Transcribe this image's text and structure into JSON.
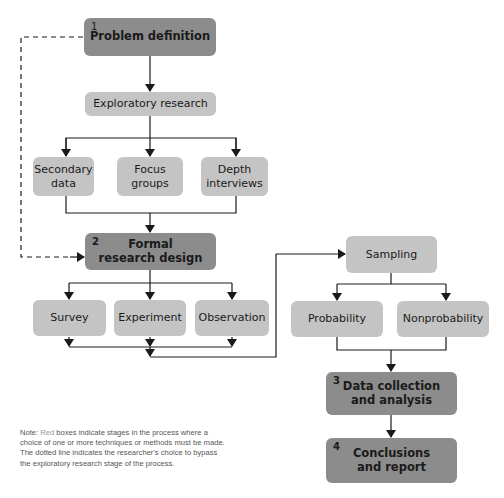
{
  "diagram": {
    "type": "flowchart",
    "colors": {
      "stage_box": "#8c8c8c",
      "option_box": "#c4c4c4",
      "line": "#1a1a1a"
    },
    "stages": [
      {
        "number": "1",
        "label": "Problem definition"
      },
      {
        "number": "2",
        "label": "Formal\nresearch design"
      },
      {
        "number": "3",
        "label": "Data collection\nand analysis"
      },
      {
        "number": "4",
        "label": "Conclusions\nand report"
      }
    ],
    "exploratory": {
      "label": "Exploratory research",
      "options": [
        "Secondary\ndata",
        "Focus\ngroups",
        "Depth\ninterviews"
      ]
    },
    "design_options": [
      "Survey",
      "Experiment",
      "Observation"
    ],
    "sampling": {
      "label": "Sampling",
      "options": [
        "Probability",
        "Nonprobability"
      ]
    },
    "note": {
      "prefix": "Note: ",
      "highlight": "Red",
      "text": " boxes indicate stages in the process where a choice of one or more techniques or methods must be made. The dotted line indicates the researcher's choice to bypass the exploratory research stage of the process."
    }
  }
}
